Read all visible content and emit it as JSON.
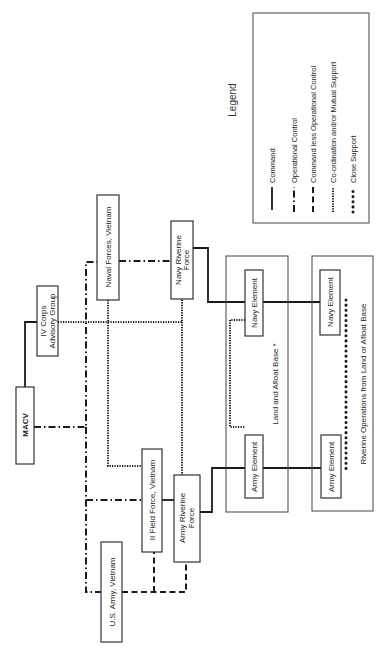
{
  "diagram": {
    "orientation": "rotated 90 degrees clockwise",
    "nodes": {
      "macv": "MACV",
      "iv_corps_1": "IV Corps",
      "iv_corps_2": "Advisory Group",
      "naval_forces": "Naval Forces, Vietnam",
      "navy_riverine_1": "Navy Riverine",
      "navy_riverine_2": "Force",
      "ii_field_force": "II Field Force, Vietnam",
      "army_riverine_1": "Army Riverine",
      "army_riverine_2": "Force",
      "usarv": "U.S. Army, Vietnam",
      "land_afloat_navy_element": "Navy Element",
      "land_afloat_army_element": "Army Element",
      "land_afloat_base": "Land and Afloat Base *",
      "riverine_navy_element": "Navy Element",
      "riverine_army_element": "Army Element",
      "riverine_ops": "Riverine Operations from Land or Afloat Base"
    },
    "edges": [
      {
        "from": "MACV",
        "to": "IV Corps Advisory Group",
        "type": "Command"
      },
      {
        "from": "MACV",
        "to": "Naval Forces, Vietnam",
        "type": "Operational Control"
      },
      {
        "from": "MACV",
        "to": "II Field Force, Vietnam",
        "type": "Operational Control"
      },
      {
        "from": "MACV",
        "to": "U.S. Army, Vietnam",
        "type": "Operational Control"
      },
      {
        "from": "Naval Forces, Vietnam",
        "to": "Navy Riverine Force",
        "type": "Operational Control"
      },
      {
        "from": "II Field Force, Vietnam",
        "to": "Army Riverine Force",
        "type": "Command"
      },
      {
        "from": "U.S. Army, Vietnam",
        "to": "II Field Force, Vietnam",
        "type": "Command less Operational Control"
      },
      {
        "from": "U.S. Army, Vietnam",
        "to": "Army Riverine Force",
        "type": "Command less Operational Control"
      },
      {
        "from": "IV Corps Advisory Group",
        "to": "Naval Forces, Vietnam",
        "type": "Co-ordination and/or Mutual Support"
      },
      {
        "from": "IV Corps Advisory Group",
        "to": "Navy Riverine Force",
        "type": "Co-ordination and/or Mutual Support"
      },
      {
        "from": "Naval Forces, Vietnam",
        "to": "II Field Force, Vietnam",
        "type": "Co-ordination and/or Mutual Support"
      },
      {
        "from": "Navy Riverine Force",
        "to": "Army Riverine Force",
        "type": "Co-ordination and/or Mutual Support"
      },
      {
        "from": "Navy Element",
        "to": "Army Element",
        "type": "Co-ordination and/or Mutual Support",
        "context": "Land and Afloat Base"
      },
      {
        "from": "Navy Element",
        "to": "Army Element",
        "type": "Close Support",
        "context": "Riverine Operations"
      },
      {
        "from": "Navy Riverine Force",
        "to": "Navy Elements",
        "type": "Command"
      },
      {
        "from": "Army Riverine Force",
        "to": "Army Elements",
        "type": "Command"
      }
    ]
  },
  "legend": {
    "title": "Legend",
    "items": [
      {
        "label": "Command",
        "style": "solid"
      },
      {
        "label": "Operational Control",
        "style": "dash-dot"
      },
      {
        "label": "Command less Operational Control",
        "style": "dashed"
      },
      {
        "label": "Co-ordination and/or Mutual Support",
        "style": "dotted"
      },
      {
        "label": "Close Support",
        "style": "large-dots"
      }
    ]
  }
}
